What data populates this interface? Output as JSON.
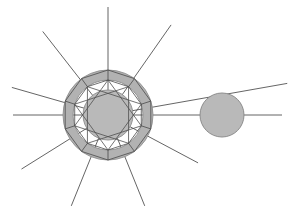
{
  "figure": {
    "canvas": {
      "width": 294,
      "height": 217,
      "background": "#ffffff"
    },
    "palette": {
      "fill_gray": "#b9b9b9",
      "ring_fill": "#b2b2b2",
      "line_gray": "#545454",
      "edge_gray": "#4a4a4a",
      "outline_gray": "#8d8d8d",
      "background": "#ffffff"
    }
  },
  "hub": {
    "label": "central hub",
    "cx": 108,
    "cy": 115,
    "inner_disc_radius": 25,
    "ring_inner_radius": 35,
    "ring_outer_radius": 45,
    "polygon_sides": 10,
    "star_points": 10,
    "star_step": 3,
    "polygon_rotation_deg": -90
  },
  "satellite": {
    "label": "satellite circle",
    "cx": 222,
    "cy": 115,
    "radius": 22
  },
  "rays": {
    "label": "radiating lines",
    "count": 11,
    "items": [
      {
        "name": "ray-up",
        "angle_deg": -90,
        "length": 108
      },
      {
        "name": "ray-upper-right",
        "angle_deg": -55,
        "length": 110
      },
      {
        "name": "ray-right-shallow",
        "angle_deg": -10,
        "length": 182
      },
      {
        "name": "ray-right",
        "angle_deg": 0,
        "length": 174
      },
      {
        "name": "ray-lower-right",
        "angle_deg": 28,
        "length": 102
      },
      {
        "name": "ray-down-right",
        "angle_deg": 68,
        "length": 98
      },
      {
        "name": "ray-down-left",
        "angle_deg": 112,
        "length": 98
      },
      {
        "name": "ray-lower-left",
        "angle_deg": 148,
        "length": 102
      },
      {
        "name": "ray-left",
        "angle_deg": 180,
        "length": 95
      },
      {
        "name": "ray-left-shallow",
        "angle_deg": 196,
        "length": 100
      },
      {
        "name": "ray-upper-left",
        "angle_deg": -128,
        "length": 106
      }
    ]
  }
}
